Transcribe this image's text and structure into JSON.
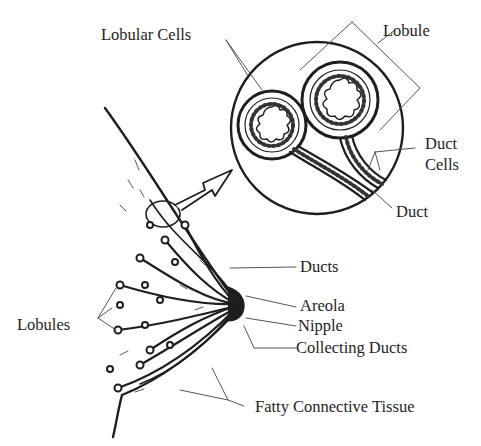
{
  "diagram": {
    "labels": {
      "lobular_cells": "Lobular Cells",
      "lobule": "Lobule",
      "duct_cells_line1": "Duct",
      "duct_cells_line2": "Cells",
      "duct": "Duct",
      "ducts": "Ducts",
      "areola": "Areola",
      "nipple": "Nipple",
      "collecting_ducts": "Collecting Ducts",
      "lobules": "Lobules",
      "fatty_connective_tissue": "Fatty Connective Tissue"
    },
    "colors": {
      "ink": "#1e1e1e",
      "leader": "#555555",
      "background": "#ffffff"
    }
  }
}
